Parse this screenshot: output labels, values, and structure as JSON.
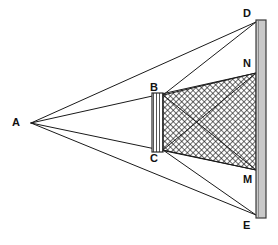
{
  "figure": {
    "canvas": {
      "width": 278,
      "height": 245
    },
    "background_color": "#ffffff",
    "line_color": "#1a1a1a",
    "hatch_color": "#1a1a1a",
    "bar_fill_color": "#c9c9c9",
    "bar_edge_color": "#3a3a3a"
  },
  "points": {
    "A": {
      "label": "A",
      "x": 31,
      "y": 123,
      "label_x": 12,
      "label_y": 117
    },
    "B": {
      "label": "B",
      "x": 163,
      "y": 95,
      "label_x": 150,
      "label_y": 82
    },
    "C": {
      "label": "C",
      "x": 163,
      "y": 150,
      "label_x": 150,
      "label_y": 153
    },
    "D": {
      "label": "D",
      "x": 256,
      "y": 22,
      "label_x": 243,
      "label_y": 8
    },
    "N": {
      "label": "N",
      "x": 256,
      "y": 73,
      "label_x": 243,
      "label_y": 58
    },
    "M": {
      "label": "M",
      "x": 256,
      "y": 170,
      "label_x": 243,
      "label_y": 174
    },
    "E": {
      "label": "E",
      "x": 256,
      "y": 215,
      "label_x": 243,
      "label_y": 220
    }
  },
  "aperture_bar": {
    "name": "aperture BC",
    "x_left": 152,
    "x_right": 163,
    "y_top": 93,
    "y_bottom": 152,
    "stripe_spacing": 3,
    "stripe_orientation": "vertical"
  },
  "screen_bar": {
    "name": "screen DE",
    "x_left": 256,
    "x_right": 266,
    "y_top": 20,
    "y_bottom": 218,
    "fill": "#c9c9c9"
  },
  "shaded_region": {
    "name": "overlap region B-N-M-C",
    "vertices": [
      "B",
      "N",
      "M",
      "C"
    ],
    "pattern": "cross-hatch",
    "hatch_spacing": 4,
    "interior_diagonals": [
      "B-M",
      "C-N"
    ]
  },
  "rays": [
    {
      "name": "A-D",
      "from": "A",
      "to": "D"
    },
    {
      "name": "A-B-N",
      "from": "A",
      "to": "N",
      "via": "B"
    },
    {
      "name": "A-C-M",
      "from": "A",
      "to": "M",
      "via": "C"
    },
    {
      "name": "A-E",
      "from": "A",
      "to": "E"
    },
    {
      "name": "B-D",
      "from": "B",
      "to": "D"
    },
    {
      "name": "C-E",
      "from": "C",
      "to": "E"
    },
    {
      "name": "B-M",
      "from": "B",
      "to": "M"
    },
    {
      "name": "C-N",
      "from": "C",
      "to": "N"
    }
  ]
}
